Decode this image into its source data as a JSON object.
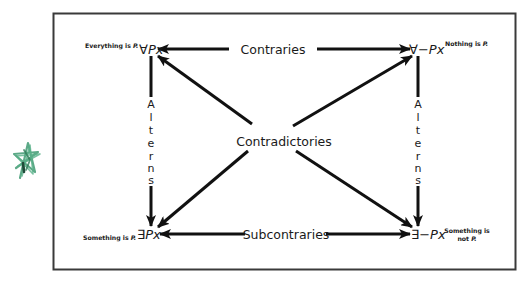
{
  "diagram": {
    "colors": {
      "frame": "#3a3a3a",
      "arrow": "#111111",
      "text": "#1a1a1a",
      "star_stroke": "#3f9a72",
      "star_dark": "#1f4a38"
    },
    "corners": {
      "top_left": {
        "quantifier": "∀",
        "formula": "Px",
        "caption": "Everything is ",
        "caption_var": "P."
      },
      "top_right": {
        "quantifier": "∀−",
        "formula": "Px",
        "caption": "Nothing is ",
        "caption_var": "P."
      },
      "bottom_left": {
        "quantifier": "∃",
        "formula": "Px",
        "caption": "Something is ",
        "caption_var": "P."
      },
      "bottom_right": {
        "quantifier": "∃−",
        "formula": "Px",
        "caption_line1": "Something is",
        "caption_line2": "not ",
        "caption_var": "P."
      }
    },
    "relations": {
      "top": "Contraries",
      "bottom": "Subcontraries",
      "center": "Contradictories",
      "left_letters": [
        "A",
        "l",
        "t",
        "e",
        "r",
        "n",
        "s"
      ],
      "right_letters": [
        "A",
        "l",
        "t",
        "e",
        "r",
        "n",
        "s"
      ]
    },
    "decoration": {
      "star_icon": "hand-drawn green star"
    }
  }
}
